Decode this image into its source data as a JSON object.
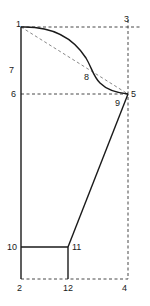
{
  "diagram": {
    "type": "pattern-draft",
    "colors": {
      "line": "#1a1a1a",
      "dashed": "#333333",
      "background": "#ffffff"
    },
    "points": [
      {
        "id": "1",
        "label": "1",
        "x": 21,
        "y": 27
      },
      {
        "id": "2",
        "label": "2",
        "x": 21,
        "y": 279
      },
      {
        "id": "3",
        "label": "3",
        "x": 128,
        "y": 27
      },
      {
        "id": "4",
        "label": "4",
        "x": 128,
        "y": 279
      },
      {
        "id": "5",
        "label": "5",
        "x": 128,
        "y": 94
      },
      {
        "id": "6",
        "label": "6",
        "x": 21,
        "y": 94
      },
      {
        "id": "7",
        "label": "7",
        "x": 21,
        "y": 70
      },
      {
        "id": "8",
        "label": "8",
        "x": 93,
        "y": 73
      },
      {
        "id": "9",
        "label": "9",
        "x": 120,
        "y": 100
      },
      {
        "id": "10",
        "label": "10",
        "x": 21,
        "y": 247
      },
      {
        "id": "11",
        "label": "11",
        "x": 68,
        "y": 247
      },
      {
        "id": "12",
        "label": "12",
        "x": 68,
        "y": 279
      }
    ],
    "labels": {
      "p1": "1",
      "p2": "2",
      "p3": "3",
      "p4": "4",
      "p5": "5",
      "p6": "6",
      "p7": "7",
      "p8": "8",
      "p9": "9",
      "p10": "10",
      "p11": "11",
      "p12": "12"
    },
    "solid_lines": [
      "1-2 (left edge)",
      "1-8-5 (S-curve)",
      "5-11 (diagonal)",
      "10-11 (horizontal)",
      "11-12 (vertical)"
    ],
    "dashed_lines": [
      "1-3 (top)",
      "3-4 (right)",
      "2-4 (bottom)",
      "6-5 (horizontal)",
      "1-5 (diagonal)"
    ]
  }
}
